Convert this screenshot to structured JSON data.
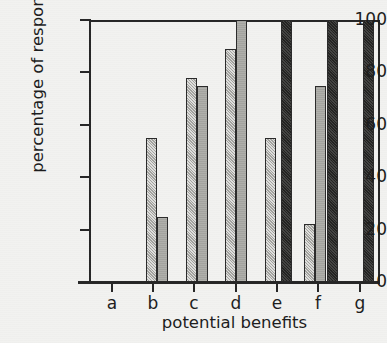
{
  "chart_data": {
    "type": "bar",
    "title": "",
    "xlabel": "potential benefits",
    "ylabel": "percentage of respondents",
    "categories": [
      "a",
      "b",
      "c",
      "d",
      "e",
      "f",
      "g"
    ],
    "ylim": [
      0,
      100
    ],
    "yticks": [
      0,
      20,
      40,
      60,
      80,
      100
    ],
    "ytick_labels": [
      "0",
      "20",
      "40",
      "60",
      "80",
      "100"
    ],
    "grid": false,
    "legend": "none",
    "series": [
      {
        "name": "series-1",
        "style": "hatched",
        "color": "#b9b9b4",
        "values": [
          0,
          55,
          78,
          89,
          55,
          22,
          0
        ]
      },
      {
        "name": "series-2",
        "style": "solid-gray",
        "color": "#a9a9a4",
        "values": [
          0,
          25,
          75,
          100,
          0,
          75,
          0
        ]
      },
      {
        "name": "series-3",
        "style": "dark",
        "color": "#2e2e2c",
        "values": [
          0,
          0,
          0,
          0,
          100,
          100,
          100
        ]
      }
    ],
    "bars": [
      {
        "category": "a",
        "series": "series-1",
        "value": 0,
        "x": 18,
        "w": 10,
        "style": "hatched"
      },
      {
        "category": "a",
        "series": "series-2",
        "value": 0,
        "x": 29,
        "w": 10,
        "style": "solid-gray"
      },
      {
        "category": "b",
        "series": "series-1",
        "value": 55,
        "x": 57,
        "w": 11,
        "style": "hatched"
      },
      {
        "category": "b",
        "series": "series-2",
        "value": 25,
        "x": 68,
        "w": 11,
        "style": "solid-gray"
      },
      {
        "category": "c",
        "series": "series-1",
        "value": 78,
        "x": 97,
        "w": 11,
        "style": "hatched"
      },
      {
        "category": "c",
        "series": "series-2",
        "value": 75,
        "x": 108,
        "w": 11,
        "style": "solid-gray"
      },
      {
        "category": "d",
        "series": "series-1",
        "value": 89,
        "x": 136,
        "w": 11,
        "style": "hatched"
      },
      {
        "category": "d",
        "series": "series-2",
        "value": 100,
        "x": 147,
        "w": 11,
        "style": "solid-gray"
      },
      {
        "category": "e",
        "series": "series-1",
        "value": 55,
        "x": 176,
        "w": 11,
        "style": "hatched"
      },
      {
        "category": "e",
        "series": "series-3",
        "value": 100,
        "x": 192,
        "w": 11,
        "style": "dark"
      },
      {
        "category": "f",
        "series": "series-1",
        "value": 22,
        "x": 215,
        "w": 11,
        "style": "hatched"
      },
      {
        "category": "f",
        "series": "series-2",
        "value": 75,
        "x": 226,
        "w": 11,
        "style": "solid-gray"
      },
      {
        "category": "f",
        "series": "series-3",
        "value": 100,
        "x": 238,
        "w": 11,
        "style": "dark"
      },
      {
        "category": "g",
        "series": "series-3",
        "value": 100,
        "x": 274,
        "w": 11,
        "style": "dark"
      }
    ]
  },
  "axes": {
    "y_ticks": [
      {
        "label": "100",
        "value": 100
      },
      {
        "label": "80",
        "value": 80
      },
      {
        "label": "60",
        "value": 60
      },
      {
        "label": "40",
        "value": 40
      },
      {
        "label": "20",
        "value": 20
      },
      {
        "label": "0",
        "value": 0
      }
    ],
    "x_ticks": [
      {
        "label": "a",
        "pos": 23
      },
      {
        "label": "b",
        "pos": 64
      },
      {
        "label": "c",
        "pos": 105
      },
      {
        "label": "d",
        "pos": 147
      },
      {
        "label": "e",
        "pos": 188
      },
      {
        "label": "f",
        "pos": 229
      },
      {
        "label": "g",
        "pos": 271
      }
    ]
  },
  "colors": {
    "background": "#f2f2f0",
    "axis": "#262626",
    "text": "#1c1c1c",
    "hatched_bar": "#b9b9b4",
    "solid_bar": "#a9a9a4",
    "dark_bar": "#2e2e2c"
  }
}
